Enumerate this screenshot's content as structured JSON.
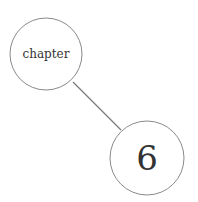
{
  "diagram": {
    "type": "node-link",
    "nodes": [
      {
        "id": "chapter",
        "label": "chapter",
        "cx": 46,
        "cy": 54,
        "r": 36
      },
      {
        "id": "six",
        "label": "6",
        "cx": 147,
        "cy": 158,
        "r": 37
      }
    ],
    "edges": [
      {
        "from": "chapter",
        "to": "six"
      }
    ],
    "colors": {
      "stroke": "#8a8a8a",
      "edge": "#7a7a7a",
      "text": "#333333",
      "background": "#ffffff"
    }
  }
}
